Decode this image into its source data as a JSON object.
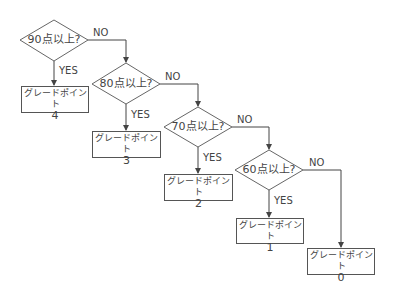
{
  "flowchart": {
    "decisions": [
      {
        "label": "90点以上?",
        "yes_label": "YES",
        "no_label": "NO"
      },
      {
        "label": "80点以上?",
        "yes_label": "YES",
        "no_label": "NO"
      },
      {
        "label": "70点以上?",
        "yes_label": "YES",
        "no_label": "NO"
      },
      {
        "label": "60点以上?",
        "yes_label": "YES",
        "no_label": "NO"
      }
    ],
    "outcomes": [
      {
        "title": "グレードポイント",
        "value": "4"
      },
      {
        "title": "グレードポイント",
        "value": "3"
      },
      {
        "title": "グレードポイント",
        "value": "2"
      },
      {
        "title": "グレードポイント",
        "value": "1"
      },
      {
        "title": "グレードポイント",
        "value": "0"
      }
    ]
  },
  "colors": {
    "stroke": "#555555",
    "text": "#444444",
    "background": "#ffffff"
  }
}
